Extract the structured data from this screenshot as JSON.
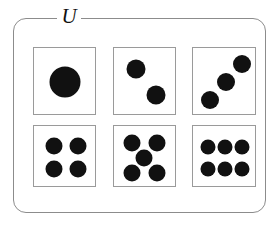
{
  "diagram": {
    "type": "venn-universal-set",
    "universe": {
      "label": "U",
      "shape": "rounded-rectangle",
      "border_color": "#8c8c8c",
      "x": 13,
      "y": 18,
      "width": 253,
      "height": 195,
      "corner_radius": 13
    },
    "pip_color": "#111111",
    "face_border_color": "#9a9a9a",
    "grid": {
      "x": 33,
      "y": 47,
      "columns": 3,
      "rows": 2
    },
    "elements": [
      {
        "name": "die-face-one",
        "value": 1,
        "pip_count": 1,
        "x": 0,
        "y": 0,
        "width": 63,
        "height": 68,
        "pips": [
          {
            "cx": 31,
            "cy": 34,
            "r": 15.5
          }
        ]
      },
      {
        "name": "die-face-two",
        "value": 2,
        "pip_count": 2,
        "x": 80,
        "y": 0,
        "width": 63,
        "height": 68,
        "pips": [
          {
            "cx": 22,
            "cy": 21,
            "r": 9.5
          },
          {
            "cx": 42,
            "cy": 47,
            "r": 9.5
          }
        ]
      },
      {
        "name": "die-face-three",
        "value": 3,
        "pip_count": 3,
        "x": 159,
        "y": 0,
        "width": 64,
        "height": 68,
        "pips": [
          {
            "cx": 17,
            "cy": 52,
            "r": 9
          },
          {
            "cx": 33,
            "cy": 34,
            "r": 9
          },
          {
            "cx": 49,
            "cy": 16,
            "r": 9
          }
        ]
      },
      {
        "name": "die-face-four",
        "value": 4,
        "pip_count": 4,
        "x": 0,
        "y": 78,
        "width": 63,
        "height": 62,
        "pips": [
          {
            "cx": 20,
            "cy": 20,
            "r": 8.5
          },
          {
            "cx": 44,
            "cy": 20,
            "r": 8.5
          },
          {
            "cx": 20,
            "cy": 43,
            "r": 8.5
          },
          {
            "cx": 44,
            "cy": 43,
            "r": 8.5
          }
        ]
      },
      {
        "name": "die-face-five",
        "value": 5,
        "pip_count": 5,
        "x": 80,
        "y": 78,
        "width": 63,
        "height": 62,
        "pips": [
          {
            "cx": 18,
            "cy": 17,
            "r": 8.5
          },
          {
            "cx": 43,
            "cy": 17,
            "r": 8.5
          },
          {
            "cx": 30,
            "cy": 32,
            "r": 8.5
          },
          {
            "cx": 18,
            "cy": 47,
            "r": 8.5
          },
          {
            "cx": 43,
            "cy": 47,
            "r": 8.5
          }
        ]
      },
      {
        "name": "die-face-six",
        "value": 6,
        "pip_count": 6,
        "x": 159,
        "y": 78,
        "width": 64,
        "height": 62,
        "pips": [
          {
            "cx": 15,
            "cy": 21,
            "r": 7.5
          },
          {
            "cx": 32,
            "cy": 21,
            "r": 7.5
          },
          {
            "cx": 49,
            "cy": 21,
            "r": 7.5
          },
          {
            "cx": 15,
            "cy": 43,
            "r": 7.5
          },
          {
            "cx": 32,
            "cy": 43,
            "r": 7.5
          },
          {
            "cx": 49,
            "cy": 43,
            "r": 7.5
          }
        ]
      }
    ]
  }
}
